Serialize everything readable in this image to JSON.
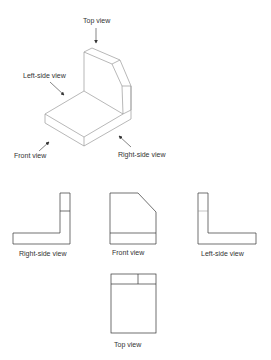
{
  "figure": {
    "isometric": {
      "labels": {
        "top": "Top view",
        "left_side": "Left-side view",
        "front": "Front view",
        "right_side": "Right-side view"
      }
    },
    "orthographic": {
      "labels": {
        "right_side": "Right-side view",
        "front": "Front view",
        "left_side": "Left-side view",
        "top": "Top view"
      }
    },
    "colors": {
      "line_iso": "#9a9a9a",
      "line_ortho": "#333333",
      "text": "#333333",
      "background": "#ffffff"
    }
  }
}
